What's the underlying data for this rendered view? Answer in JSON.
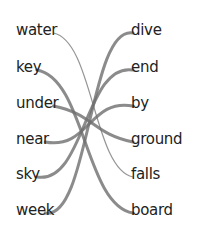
{
  "worksheet": {
    "left_words": [
      "water",
      "key",
      "under",
      "near",
      "sky",
      "week"
    ],
    "right_words": [
      "dive",
      "end",
      "by",
      "ground",
      "falls",
      "board"
    ],
    "matches": [
      {
        "left": "water",
        "right": "falls",
        "style": "thin"
      },
      {
        "left": "key",
        "right": "board",
        "style": "thick"
      },
      {
        "left": "under",
        "right": "ground",
        "style": "thick"
      },
      {
        "left": "near",
        "right": "by",
        "style": "thick"
      },
      {
        "left": "sky",
        "right": "end",
        "style": "thick"
      },
      {
        "left": "week",
        "right": "dive",
        "style": "thick"
      }
    ],
    "line_colors": {
      "thin": "#8a8a8a",
      "thick": "#6e6e6e"
    }
  }
}
